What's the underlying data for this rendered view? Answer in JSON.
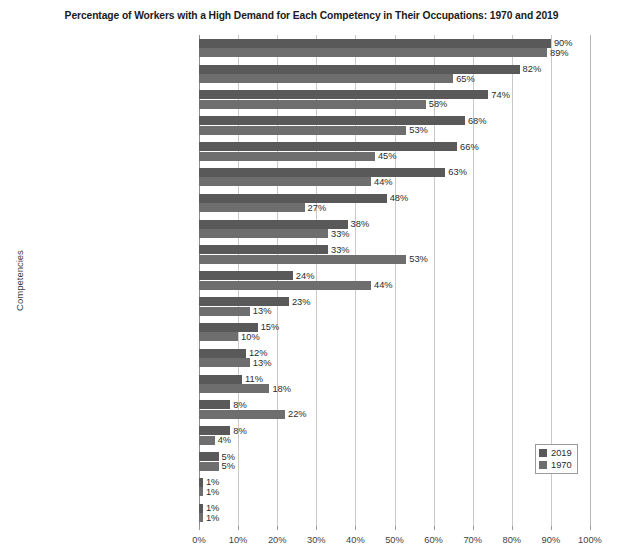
{
  "chart_data": {
    "type": "bar",
    "title": "Percentage of Workers with a High Demand for Each Competency in Their Occupations: 1970 and 2019",
    "xlabel": "",
    "ylabel": "Competencies",
    "orientation": "horizontal",
    "grid": true,
    "legend_position": "bottom-right",
    "xlim": [
      0,
      100
    ],
    "xtick_labels": [
      "0%",
      "10%",
      "20%",
      "30%",
      "40%",
      "50%",
      "60%",
      "70%",
      "80%",
      "90%",
      "100%"
    ],
    "xticks": [
      0,
      10,
      20,
      30,
      40,
      50,
      60,
      70,
      80,
      90,
      100
    ],
    "value_suffix": "%",
    "categories": [
      "Communication",
      "Teamwork",
      "Sales and Customer Service",
      "Perception and Attentiveness",
      "Leadership",
      "Problem Solving and Complex Thinking",
      "Teaching and Learning",
      "Digital Technology",
      "Vision and Hearing",
      "Fine-Motor Abilities",
      "Business and Economics",
      "Mathematics and Computer Science",
      "Engineering and Physical Sciences",
      "Psychomotor and Sensory Abilities",
      "Mechanical Skills",
      "Health Sciences",
      "Spatial Navigation",
      "Strength and Coordination",
      "Humanities"
    ],
    "series": [
      {
        "name": "2019",
        "color": "#595959",
        "values": [
          90,
          82,
          74,
          68,
          66,
          63,
          48,
          38,
          33,
          24,
          23,
          15,
          12,
          11,
          8,
          8,
          5,
          1,
          1
        ],
        "labels": [
          "90%",
          "82%",
          "74%",
          "68%",
          "66%",
          "63%",
          "48%",
          "38%",
          "33%",
          "24%",
          "23%",
          "15%",
          "12%",
          "11%",
          "8%",
          "8%",
          "5%",
          "1%",
          "1%"
        ]
      },
      {
        "name": "1970",
        "color": "#6e6e6e",
        "values": [
          89,
          65,
          58,
          53,
          45,
          44,
          27,
          33,
          53,
          44,
          13,
          10,
          13,
          18,
          22,
          4,
          5,
          1,
          1
        ],
        "labels": [
          "89%",
          "65%",
          "58%",
          "53%",
          "45%",
          "44%",
          "27%",
          "33%",
          "53%",
          "44%",
          "13%",
          "10%",
          "13%",
          "18%",
          "22%",
          "4%",
          "5%",
          "1%",
          "1%"
        ]
      }
    ]
  }
}
